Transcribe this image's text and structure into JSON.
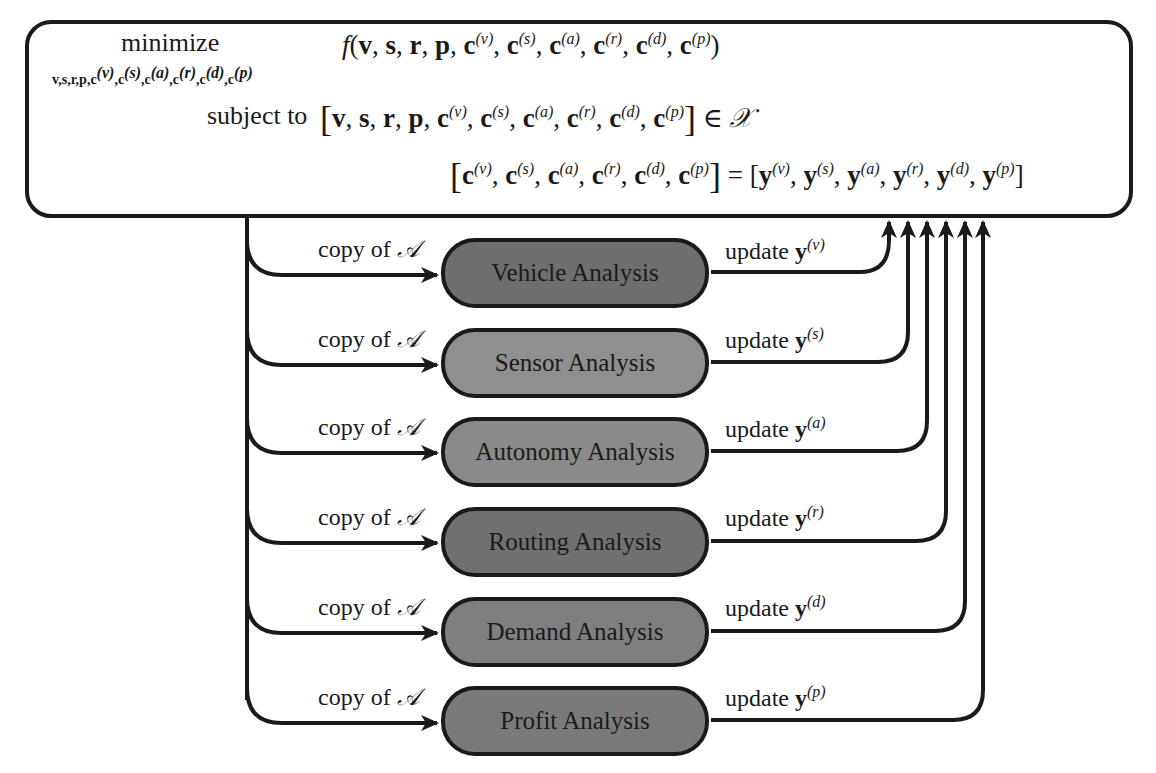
{
  "problem": {
    "minimize_label": "minimize",
    "minimize_vars": "v,s,r,p,c(v),c(s),c(a),c(r),c(d),c(p)",
    "objective": "f(v, s, r, p, c(v), c(s), c(a), c(r), c(d), c(p))",
    "subject_to_label": "subject to",
    "constraint_1": "[v, s, r, p, c(v), c(s), c(a), c(r), c(d), c(p)] ∈ 𝒳",
    "constraint_2": "[c(v), c(s), c(a), c(r), c(d), c(p)] = [y(v), y(s), y(a), y(r), y(d), y(p)]",
    "set_symbol": "𝒳"
  },
  "analyses": [
    {
      "label": "Vehicle Analysis",
      "superscript": "v",
      "input_label": "copy of",
      "input_symbol": "𝒜",
      "output_label": "update",
      "output_var": "y",
      "fill": "#6e6e6e"
    },
    {
      "label": "Sensor Analysis",
      "superscript": "s",
      "input_label": "copy of",
      "input_symbol": "𝒜",
      "output_label": "update",
      "output_var": "y",
      "fill": "#8f8f8f"
    },
    {
      "label": "Autonomy Analysis",
      "superscript": "a",
      "input_label": "copy of",
      "input_symbol": "𝒜",
      "output_label": "update",
      "output_var": "y",
      "fill": "#8a8a8a"
    },
    {
      "label": "Routing Analysis",
      "superscript": "r",
      "input_label": "copy of",
      "input_symbol": "𝒜",
      "output_label": "update",
      "output_var": "y",
      "fill": "#707070"
    },
    {
      "label": "Demand Analysis",
      "superscript": "d",
      "input_label": "copy of",
      "input_symbol": "𝒜",
      "output_label": "update",
      "output_var": "y",
      "fill": "#7f7f7f"
    },
    {
      "label": "Profit Analysis",
      "superscript": "p",
      "input_label": "copy of",
      "input_symbol": "𝒜",
      "output_label": "update",
      "output_var": "y",
      "fill": "#7a7a7a"
    }
  ],
  "colors": {
    "stroke": "#1a1a1a",
    "background": "#ffffff"
  }
}
